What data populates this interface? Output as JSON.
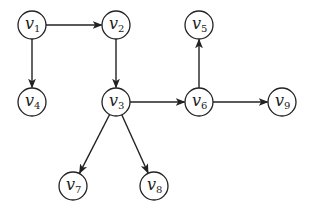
{
  "diagram": {
    "type": "directed-graph",
    "node_radius": 14,
    "stroke_color": "#222222",
    "nodes": [
      {
        "id": "v1",
        "base": "v",
        "sub": "1",
        "x": 32,
        "y": 25
      },
      {
        "id": "v2",
        "base": "v",
        "sub": "2",
        "x": 116,
        "y": 25
      },
      {
        "id": "v5",
        "base": "v",
        "sub": "5",
        "x": 199,
        "y": 25
      },
      {
        "id": "v4",
        "base": "v",
        "sub": "4",
        "x": 32,
        "y": 102
      },
      {
        "id": "v3",
        "base": "v",
        "sub": "3",
        "x": 116,
        "y": 102
      },
      {
        "id": "v6",
        "base": "v",
        "sub": "6",
        "x": 199,
        "y": 102
      },
      {
        "id": "v9",
        "base": "v",
        "sub": "9",
        "x": 282,
        "y": 102
      },
      {
        "id": "v7",
        "base": "v",
        "sub": "7",
        "x": 73,
        "y": 186
      },
      {
        "id": "v8",
        "base": "v",
        "sub": "8",
        "x": 154,
        "y": 186
      }
    ],
    "edges": [
      {
        "from": "v1",
        "to": "v2"
      },
      {
        "from": "v1",
        "to": "v4"
      },
      {
        "from": "v2",
        "to": "v3"
      },
      {
        "from": "v3",
        "to": "v6"
      },
      {
        "from": "v3",
        "to": "v7"
      },
      {
        "from": "v3",
        "to": "v8"
      },
      {
        "from": "v6",
        "to": "v5"
      },
      {
        "from": "v6",
        "to": "v9"
      }
    ]
  }
}
